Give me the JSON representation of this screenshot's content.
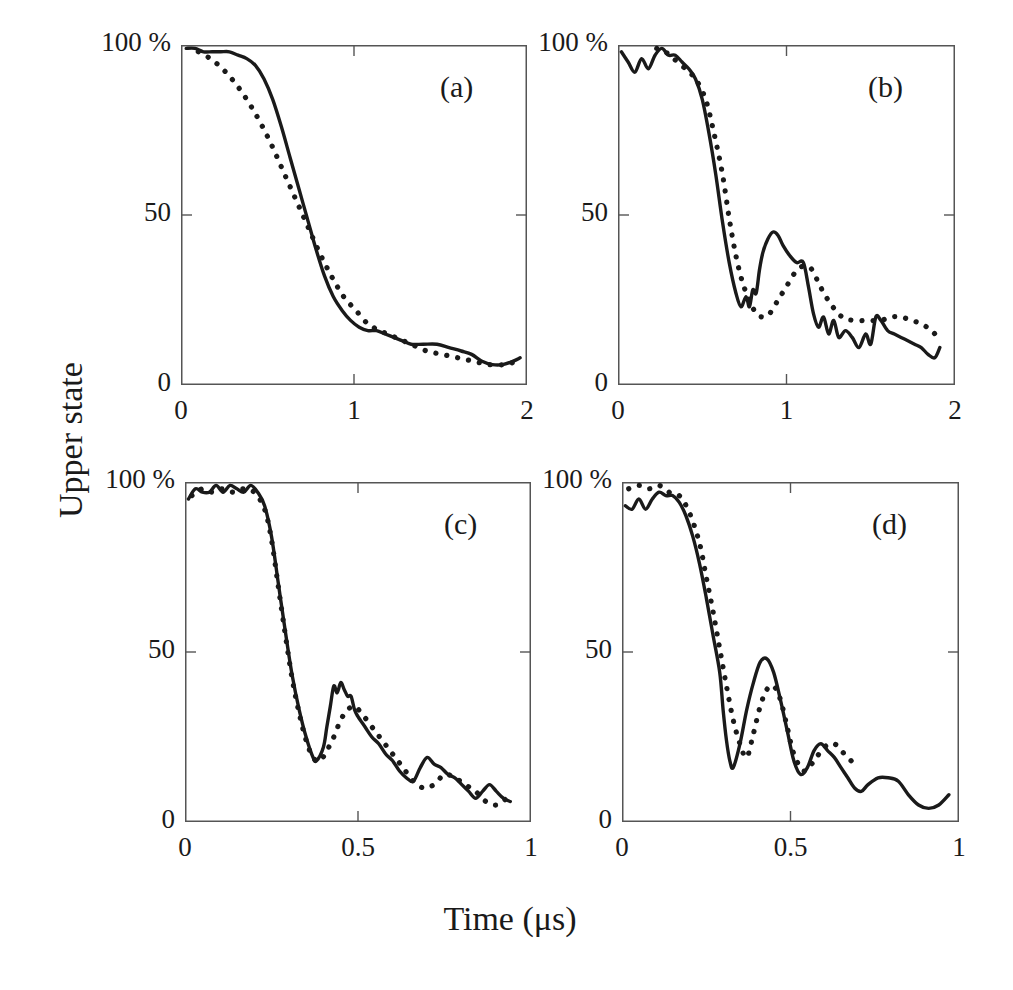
{
  "figure": {
    "ylabel": "Upper state",
    "xlabel": "Time (μs)",
    "line_color": "#1a1a1a",
    "axis_color": "#555555",
    "background": "#ffffff"
  },
  "chart_data": [
    {
      "type": "line",
      "panel": "(a)",
      "title": "",
      "xlabel": "Time (μs)",
      "ylabel": "Upper state",
      "xlim": [
        0,
        2
      ],
      "ylim": [
        0,
        100
      ],
      "xticks": [
        0,
        1,
        2
      ],
      "xticklabels": [
        "0",
        "1",
        "2"
      ],
      "yticks": [
        0,
        50,
        100
      ],
      "yticklabels": [
        "0",
        "50",
        "100 %"
      ],
      "grid": false,
      "legend": "none",
      "series": [
        {
          "name": "experiment",
          "style": "solid",
          "x": [
            0.03,
            0.08,
            0.13,
            0.18,
            0.23,
            0.28,
            0.33,
            0.38,
            0.43,
            0.48,
            0.53,
            0.58,
            0.63,
            0.68,
            0.73,
            0.78,
            0.83,
            0.88,
            0.93,
            0.98,
            1.03,
            1.08,
            1.13,
            1.18,
            1.23,
            1.28,
            1.33,
            1.4,
            1.48,
            1.55,
            1.62,
            1.68,
            1.74,
            1.8,
            1.86,
            1.92,
            1.96
          ],
          "y": [
            99,
            99,
            98,
            98,
            98,
            98,
            97,
            96,
            94,
            90,
            84,
            76,
            67,
            58,
            49,
            40,
            32,
            26,
            22,
            19,
            17,
            16,
            16,
            15,
            14,
            13,
            12,
            12,
            12,
            11,
            10,
            9,
            7,
            6,
            6,
            7,
            8
          ]
        },
        {
          "name": "theory",
          "style": "dotted",
          "x": [
            0.1,
            0.17,
            0.24,
            0.31,
            0.38,
            0.45,
            0.52,
            0.59,
            0.66,
            0.73,
            0.8,
            0.87,
            0.94,
            1.01,
            1.08,
            1.15,
            1.24,
            1.33,
            1.42,
            1.51,
            1.6,
            1.69,
            1.78,
            1.87,
            1.94
          ],
          "y": [
            98,
            96,
            93,
            89,
            84,
            78,
            71,
            63,
            55,
            47,
            39,
            32,
            26,
            22,
            18,
            16,
            14,
            12,
            10,
            9,
            8,
            7,
            6,
            6,
            7
          ]
        }
      ]
    },
    {
      "type": "line",
      "panel": "(b)",
      "title": "",
      "xlabel": "Time (μs)",
      "ylabel": "Upper state",
      "xlim": [
        0,
        2
      ],
      "ylim": [
        0,
        100
      ],
      "xticks": [
        0,
        1,
        2
      ],
      "xticklabels": [
        "0",
        "1",
        "2"
      ],
      "yticks": [
        0,
        50,
        100
      ],
      "yticklabels": [
        "0",
        "50",
        "100 %"
      ],
      "grid": false,
      "legend": "none",
      "series": [
        {
          "name": "experiment",
          "style": "solid",
          "x": [
            0.02,
            0.06,
            0.1,
            0.14,
            0.18,
            0.22,
            0.26,
            0.3,
            0.34,
            0.38,
            0.42,
            0.46,
            0.5,
            0.54,
            0.58,
            0.62,
            0.66,
            0.7,
            0.73,
            0.76,
            0.78,
            0.8,
            0.82,
            0.84,
            0.86,
            0.89,
            0.92,
            0.95,
            0.98,
            1.02,
            1.06,
            1.1,
            1.13,
            1.16,
            1.19,
            1.22,
            1.25,
            1.28,
            1.31,
            1.35,
            1.39,
            1.43,
            1.47,
            1.5,
            1.53,
            1.56,
            1.6,
            1.64,
            1.68,
            1.72,
            1.76,
            1.8,
            1.84,
            1.88,
            1.91
          ],
          "y": [
            98,
            95,
            92,
            96,
            93,
            97,
            99,
            97,
            97,
            95,
            93,
            90,
            84,
            74,
            62,
            48,
            36,
            27,
            23,
            26,
            23,
            28,
            27,
            34,
            39,
            43,
            45,
            44,
            41,
            38,
            36,
            36,
            29,
            21,
            17,
            20,
            15,
            19,
            14,
            16,
            14,
            11,
            15,
            12,
            20,
            19,
            16,
            15,
            14,
            13,
            12,
            11,
            9,
            8,
            11
          ]
        },
        {
          "name": "theory",
          "style": "dotted",
          "x": [
            0.23,
            0.28,
            0.33,
            0.4,
            0.46,
            0.52,
            0.57,
            0.62,
            0.66,
            0.7,
            0.74,
            0.78,
            0.82,
            0.86,
            0.9,
            0.95,
            1.0,
            1.05,
            1.1,
            1.15,
            1.2,
            1.26,
            1.33,
            1.4,
            1.48,
            1.56,
            1.62,
            1.68,
            1.74,
            1.8,
            1.86,
            1.92
          ],
          "y": [
            99,
            98,
            96,
            93,
            90,
            84,
            74,
            62,
            49,
            38,
            30,
            25,
            21,
            20,
            21,
            25,
            29,
            33,
            35,
            34,
            29,
            24,
            20,
            19,
            19,
            19,
            20,
            20,
            19,
            18,
            16,
            13
          ]
        }
      ]
    },
    {
      "type": "line",
      "panel": "(c)",
      "title": "",
      "xlabel": "Time (μs)",
      "ylabel": "Upper state",
      "xlim": [
        0,
        1
      ],
      "ylim": [
        0,
        100
      ],
      "xticks": [
        0,
        0.5,
        1
      ],
      "xticklabels": [
        "0",
        "0.5",
        "1"
      ],
      "yticks": [
        0,
        50,
        100
      ],
      "yticklabels": [
        "0",
        "50",
        "100 %"
      ],
      "grid": false,
      "legend": "none",
      "series": [
        {
          "name": "experiment",
          "style": "solid",
          "x": [
            0.01,
            0.03,
            0.05,
            0.07,
            0.09,
            0.11,
            0.13,
            0.15,
            0.17,
            0.19,
            0.21,
            0.23,
            0.25,
            0.27,
            0.29,
            0.31,
            0.33,
            0.35,
            0.37,
            0.38,
            0.4,
            0.41,
            0.42,
            0.43,
            0.44,
            0.45,
            0.46,
            0.47,
            0.48,
            0.49,
            0.5,
            0.52,
            0.54,
            0.56,
            0.58,
            0.6,
            0.62,
            0.64,
            0.66,
            0.68,
            0.7,
            0.72,
            0.74,
            0.76,
            0.78,
            0.8,
            0.82,
            0.84,
            0.86,
            0.88,
            0.9,
            0.92,
            0.94
          ],
          "y": [
            95,
            98,
            97,
            97,
            99,
            97,
            99,
            98,
            97,
            99,
            97,
            93,
            84,
            70,
            56,
            43,
            33,
            25,
            19,
            18,
            22,
            28,
            34,
            40,
            38,
            41,
            39,
            37,
            37,
            33,
            31,
            28,
            25,
            23,
            20,
            18,
            15,
            13,
            12,
            16,
            19,
            17,
            16,
            14,
            13,
            11,
            9,
            7,
            9,
            11,
            9,
            7,
            6
          ]
        },
        {
          "name": "theory",
          "style": "dotted",
          "x": [
            0.02,
            0.05,
            0.08,
            0.11,
            0.14,
            0.17,
            0.2,
            0.23,
            0.25,
            0.27,
            0.29,
            0.31,
            0.33,
            0.35,
            0.37,
            0.39,
            0.41,
            0.43,
            0.45,
            0.47,
            0.49,
            0.51,
            0.54,
            0.57,
            0.6,
            0.63,
            0.66,
            0.69,
            0.72,
            0.75,
            0.78,
            0.81,
            0.84,
            0.87,
            0.9,
            0.93
          ],
          "y": [
            96,
            98,
            97,
            98,
            97,
            98,
            97,
            92,
            83,
            69,
            55,
            42,
            32,
            24,
            19,
            18,
            21,
            25,
            30,
            33,
            34,
            32,
            28,
            24,
            20,
            16,
            12,
            10,
            11,
            14,
            13,
            11,
            9,
            6,
            5,
            7
          ]
        }
      ]
    },
    {
      "type": "line",
      "panel": "(d)",
      "title": "",
      "xlabel": "Time (μs)",
      "ylabel": "Upper state",
      "xlim": [
        0,
        1
      ],
      "ylim": [
        0,
        100
      ],
      "xticks": [
        0,
        0.5,
        1
      ],
      "xticklabels": [
        "0",
        "0.5",
        "1"
      ],
      "yticks": [
        0,
        50,
        100
      ],
      "yticklabels": [
        "0",
        "50",
        "100 %"
      ],
      "grid": false,
      "legend": "none",
      "series": [
        {
          "name": "experiment",
          "style": "solid",
          "x": [
            0.01,
            0.03,
            0.05,
            0.07,
            0.09,
            0.11,
            0.13,
            0.15,
            0.17,
            0.19,
            0.21,
            0.23,
            0.25,
            0.27,
            0.29,
            0.3,
            0.31,
            0.32,
            0.33,
            0.35,
            0.37,
            0.39,
            0.41,
            0.43,
            0.45,
            0.47,
            0.49,
            0.51,
            0.53,
            0.55,
            0.57,
            0.59,
            0.61,
            0.63,
            0.65,
            0.67,
            0.69,
            0.71,
            0.73,
            0.76,
            0.79,
            0.82,
            0.85,
            0.88,
            0.91,
            0.94,
            0.97
          ],
          "y": [
            93,
            92,
            95,
            92,
            95,
            97,
            96,
            96,
            94,
            90,
            84,
            76,
            66,
            55,
            44,
            33,
            24,
            18,
            16,
            23,
            33,
            41,
            47,
            48,
            44,
            36,
            27,
            18,
            14,
            16,
            21,
            23,
            21,
            19,
            16,
            13,
            10,
            9,
            11,
            13,
            13,
            12,
            8,
            5,
            4,
            5,
            8
          ]
        },
        {
          "name": "theory",
          "style": "dotted",
          "x": [
            0.02,
            0.05,
            0.08,
            0.11,
            0.14,
            0.17,
            0.2,
            0.23,
            0.25,
            0.27,
            0.29,
            0.31,
            0.33,
            0.35,
            0.37,
            0.39,
            0.41,
            0.43,
            0.45,
            0.47,
            0.49,
            0.51,
            0.54,
            0.57,
            0.6,
            0.63,
            0.66,
            0.69
          ],
          "y": [
            98,
            99,
            98,
            99,
            97,
            96,
            91,
            82,
            72,
            62,
            51,
            40,
            30,
            23,
            19,
            26,
            34,
            39,
            40,
            36,
            28,
            20,
            15,
            18,
            22,
            23,
            20,
            17
          ]
        }
      ]
    }
  ]
}
